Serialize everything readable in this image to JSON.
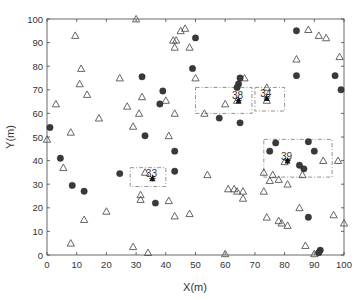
{
  "chart_data": {
    "type": "scatter",
    "title": "",
    "xlabel": "X(m)",
    "ylabel": "Y(m)",
    "xlim": [
      0,
      100
    ],
    "ylim": [
      0,
      100
    ],
    "xticks": [
      "0",
      "10",
      "20",
      "30",
      "40",
      "50",
      "60",
      "70",
      "80",
      "90",
      "100"
    ],
    "yticks": [
      "0",
      "10",
      "20",
      "30",
      "40",
      "50",
      "60",
      "70",
      "80",
      "90",
      "100"
    ],
    "grid": false,
    "legend": null,
    "series": [
      {
        "name": "triangles",
        "marker": "open-triangle",
        "color": "#555555",
        "points": [
          [
            30,
            100
          ],
          [
            9.5,
            93
          ],
          [
            11.5,
            79
          ],
          [
            11,
            72.5
          ],
          [
            13.5,
            68
          ],
          [
            3,
            64
          ],
          [
            17.5,
            58
          ],
          [
            8,
            52
          ],
          [
            0,
            49
          ],
          [
            27,
            63
          ],
          [
            29,
            54.5
          ],
          [
            32,
            67
          ],
          [
            31,
            60
          ],
          [
            40,
            65.5
          ],
          [
            41,
            50.5
          ],
          [
            43,
            60
          ],
          [
            45,
            95
          ],
          [
            46.5,
            96
          ],
          [
            43.5,
            91
          ],
          [
            43,
            88
          ],
          [
            42.5,
            91
          ],
          [
            48,
            88
          ],
          [
            24.5,
            75
          ],
          [
            50,
            75
          ],
          [
            66.5,
            75
          ],
          [
            74,
            71
          ],
          [
            84,
            83
          ],
          [
            88,
            95.5
          ],
          [
            91.5,
            93
          ],
          [
            94,
            92
          ],
          [
            98.5,
            84
          ],
          [
            98,
            40
          ],
          [
            53,
            60
          ],
          [
            60,
            64
          ],
          [
            64,
            65.5
          ],
          [
            74,
            65.5
          ],
          [
            5.5,
            37
          ],
          [
            12.5,
            15
          ],
          [
            20,
            18.5
          ],
          [
            8,
            5
          ],
          [
            29,
            3.5
          ],
          [
            31.5,
            25.5
          ],
          [
            31.5,
            23.5
          ],
          [
            34,
            1
          ],
          [
            33,
            35
          ],
          [
            41,
            23
          ],
          [
            43,
            16.5
          ],
          [
            54,
            34
          ],
          [
            61,
            28
          ],
          [
            66,
            27
          ],
          [
            73,
            27
          ],
          [
            76,
            34
          ],
          [
            78,
            32
          ],
          [
            80,
            39.5
          ],
          [
            81,
            30
          ],
          [
            93,
            40
          ],
          [
            48,
            17.5
          ],
          [
            60,
            0.5
          ],
          [
            63,
            28
          ],
          [
            64,
            27
          ],
          [
            73,
            35
          ],
          [
            75,
            31.5
          ],
          [
            66,
            24
          ],
          [
            86,
            34
          ],
          [
            74,
            16
          ],
          [
            78,
            14.5
          ],
          [
            79,
            13.5
          ],
          [
            81,
            12.5
          ],
          [
            85,
            20
          ],
          [
            96.5,
            17
          ],
          [
            100,
            13.5
          ],
          [
            87,
            4
          ],
          [
            90,
            0.5
          ]
        ]
      },
      {
        "name": "circles",
        "marker": "filled-circle",
        "color": "#3a3a3a",
        "points": [
          [
            1,
            54
          ],
          [
            32,
            75.5
          ],
          [
            39,
            69.5
          ],
          [
            38,
            64
          ],
          [
            33,
            50.5
          ],
          [
            43,
            44
          ],
          [
            4.5,
            41
          ],
          [
            8.5,
            29.5
          ],
          [
            12.5,
            27
          ],
          [
            24.5,
            34.5
          ],
          [
            36.5,
            22
          ],
          [
            43,
            35.5
          ],
          [
            50,
            92
          ],
          [
            49,
            79
          ],
          [
            65,
            75
          ],
          [
            64.5,
            72.5
          ],
          [
            64,
            71
          ],
          [
            84,
            95
          ],
          [
            84,
            76
          ],
          [
            97,
            76
          ],
          [
            99,
            70
          ],
          [
            58,
            58
          ],
          [
            65,
            56
          ],
          [
            77,
            47.5
          ],
          [
            88,
            48
          ],
          [
            90,
            44
          ],
          [
            85,
            38
          ],
          [
            86.5,
            36.5
          ],
          [
            75,
            44
          ],
          [
            88,
            16
          ],
          [
            92,
            2
          ],
          [
            91.5,
            1
          ]
        ]
      }
    ],
    "clusters": [
      {
        "label": "33",
        "star": [
          35.5,
          32.5
        ],
        "box": [
          28,
          29,
          40,
          37
        ]
      },
      {
        "label": "38",
        "star": [
          64.5,
          65.5
        ],
        "box": [
          50,
          60,
          69,
          71
        ]
      },
      {
        "label": "34",
        "star": [
          74,
          66.5
        ],
        "box": [
          70,
          61,
          80,
          71
        ]
      },
      {
        "label": "39",
        "star": [
          81,
          40
        ],
        "box": [
          73,
          33,
          96,
          49
        ]
      }
    ]
  }
}
